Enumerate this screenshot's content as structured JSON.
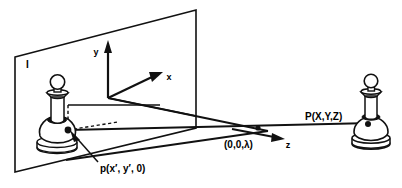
{
  "figure": {
    "background_color": "#ffffff",
    "ink_color": "#111111",
    "width": 402,
    "height": 188
  },
  "labels": {
    "image_plane": "I",
    "axis_x": "x",
    "axis_y": "y",
    "axis_z": "z",
    "focal_point": "(0,0,λ)",
    "world_point": "P(X,Y,Z)",
    "image_point": "p(x′, y′, 0)"
  },
  "geometry": {
    "image_plane_polygon": "15,57 196,10 196,128 15,172",
    "origin": {
      "x": 108,
      "y": 98
    },
    "axis_y_tip": {
      "x": 108,
      "y": 42
    },
    "axis_x_tip": {
      "x": 160,
      "y": 74
    },
    "axis_z_tip": {
      "x": 284,
      "y": 137
    },
    "image_point_dot": {
      "x": 68,
      "y": 130
    },
    "focal_point_dot": {
      "x": 258,
      "y": 128
    },
    "world_point_dot": {
      "x": 368,
      "y": 124
    }
  },
  "elements": {
    "left_pawn_name": "image-of-pawn",
    "right_pawn_name": "world-pawn"
  }
}
